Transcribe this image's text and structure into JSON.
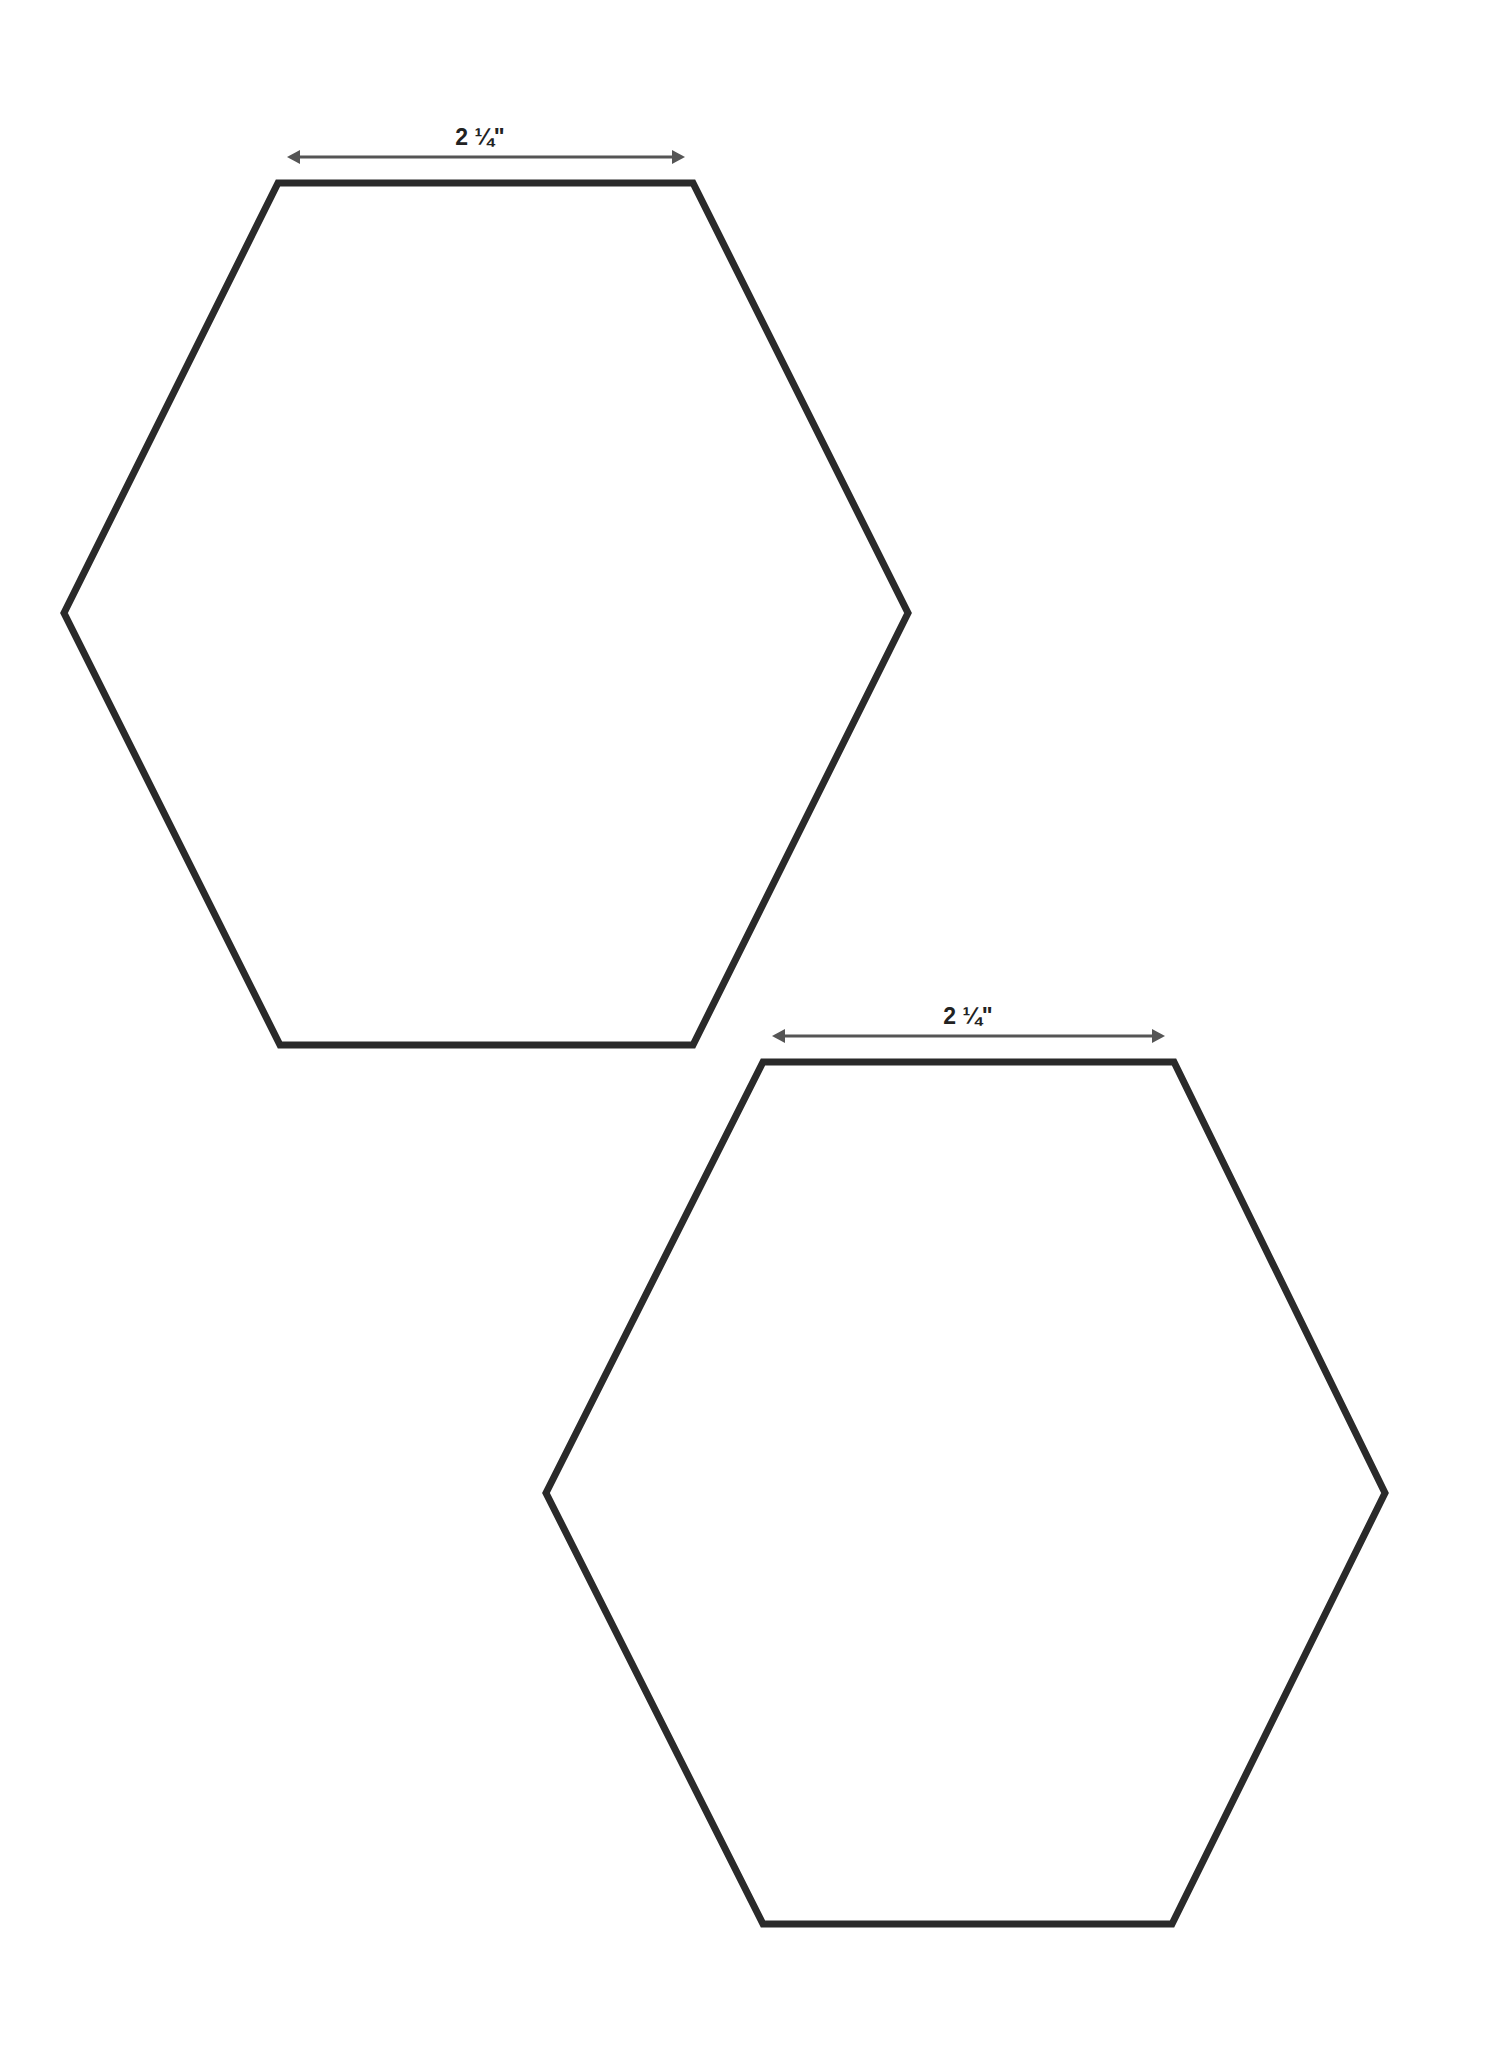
{
  "page": {
    "background": "#ffffff",
    "stroke_color": "#2a2a2a",
    "arrow_color": "#555555"
  },
  "templates": [
    {
      "shape": "hexagon",
      "dimension_label": "2 ¼\"",
      "label_pos": [
        480,
        128
      ],
      "arrow": {
        "x1": 287,
        "x2": 685,
        "y": 157
      },
      "vertices": [
        [
          278,
          183
        ],
        [
          693,
          183
        ],
        [
          908,
          613
        ],
        [
          693,
          1045
        ],
        [
          280,
          1045
        ],
        [
          64,
          613
        ]
      ]
    },
    {
      "shape": "hexagon",
      "dimension_label": "2 ¼\"",
      "label_pos": [
        968,
        1007
      ],
      "arrow": {
        "x1": 772,
        "x2": 1165,
        "y": 1036
      },
      "vertices": [
        [
          763,
          1062
        ],
        [
          1174,
          1062
        ],
        [
          1385,
          1493
        ],
        [
          1172,
          1924
        ],
        [
          763,
          1924
        ],
        [
          546,
          1493
        ]
      ]
    }
  ]
}
